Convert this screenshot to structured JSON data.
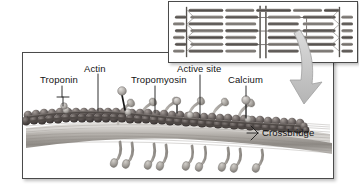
{
  "figure": {
    "background_color": "#ffffff",
    "panel_border_color": "#4a4a4a"
  },
  "main_panel": {
    "name": "myofilament-detail-panel",
    "labels": [
      {
        "id": "troponin",
        "text": "Troponin",
        "x": 40,
        "y": 81
      },
      {
        "id": "actin",
        "text": "Actin",
        "x": 84,
        "y": 70
      },
      {
        "id": "tropomyosin",
        "text": "Tropomyosin",
        "x": 131,
        "y": 81
      },
      {
        "id": "active-site",
        "text": "Active site",
        "x": 177,
        "y": 70
      },
      {
        "id": "calcium",
        "text": "Calcium",
        "x": 239,
        "y": 81
      },
      {
        "id": "crossbridge",
        "text": "Crossbridge",
        "x": 262,
        "y": 130
      }
    ]
  },
  "inset_panel": {
    "name": "sarcomere-inset-panel",
    "description": "Sarcomere showing overlapping thick and thin filaments with Z-lines and M-line"
  },
  "callout_arrow": {
    "name": "inset-to-detail-arrow",
    "color": "#b9b9b9",
    "direction": "down-left"
  },
  "colors": {
    "actin_bead_dark": "#4b4646",
    "actin_bead_mid": "#6d6664",
    "actin_bead_light": "#938b88",
    "tropomyosin_strand": "#5c5654",
    "calcium_sphere": "#b6b2af",
    "myosin_filament": "#a9a6a2",
    "crossbridge_head": "#9c9894",
    "leader_line": "#1a1a1a"
  }
}
